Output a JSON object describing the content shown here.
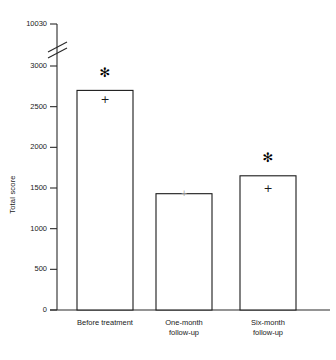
{
  "chart_data": {
    "type": "bar",
    "title": "",
    "subtitle": "",
    "xlabel": "",
    "ylabel": "Total score",
    "categories": [
      "Before treatment",
      "One-month\nfollow-up",
      "Six-month\nfollow-up"
    ],
    "values": [
      2700,
      1430,
      1650
    ],
    "ylim": [
      0,
      10030
    ],
    "yticks": [
      0,
      500,
      1000,
      1500,
      2000,
      2500,
      3000,
      10030
    ],
    "ytick_labels": [
      "0",
      "500",
      "1000",
      "1500",
      "2000",
      "2500",
      "3000",
      "10030"
    ],
    "axis_break": {
      "present": true,
      "between": [
        3000,
        10030
      ],
      "style": "double-slash"
    },
    "grid": false,
    "legend": null,
    "bar_style": {
      "fill": "#ffffff",
      "edge": "#1a1a1a"
    },
    "annotations": [
      {
        "symbol": "*",
        "category": "Before treatment",
        "at_value": 2920
      },
      {
        "symbol": "+",
        "category": "Before treatment",
        "at_value": 2580
      },
      {
        "symbol": "+",
        "category": "One-month\nfollow-up",
        "at_value": 1430
      },
      {
        "symbol": "*",
        "category": "Six-month\nfollow-up",
        "at_value": 1870
      },
      {
        "symbol": "+",
        "category": "Six-month\nfollow-up",
        "at_value": 1490
      }
    ]
  }
}
